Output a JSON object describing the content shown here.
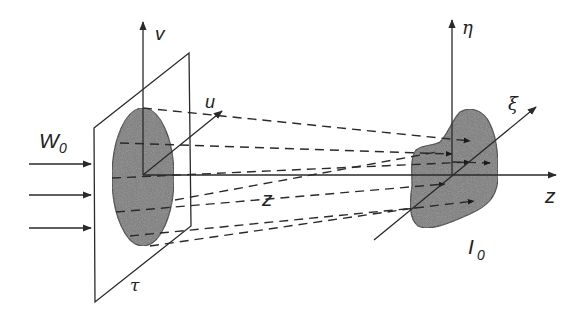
{
  "diagram": {
    "type": "optics-propagation-schematic",
    "labels": {
      "input_wave": "W",
      "input_wave_sub": "0",
      "source_plane": "τ",
      "axis_u": "u",
      "axis_v": "v",
      "propagation_distance": "z",
      "axis_z": "z",
      "axis_xi": "ξ",
      "axis_eta": "η",
      "output_intensity": "I",
      "output_intensity_sub": "0"
    },
    "colors": {
      "stroke": "#2a2a2a",
      "fill_shape": "#7a7a7a",
      "background": "#ffffff"
    },
    "incoming_arrows": 3,
    "dashed_rays": 6
  }
}
